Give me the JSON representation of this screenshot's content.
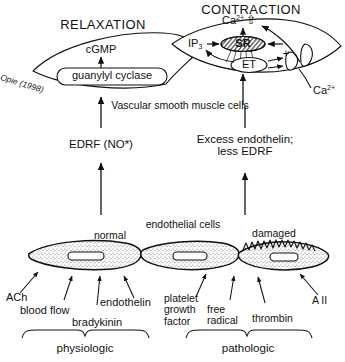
{
  "diagram": {
    "credit": "Opie (1998)",
    "headings": {
      "relaxation": "RELAXATION",
      "contraction": "CONTRACTION"
    },
    "relaxation_cell": {
      "messenger": "cGMP",
      "enzyme": "guanylyl cyclase"
    },
    "contraction_cell": {
      "calcium_increase": "Ca",
      "calcium_increase_sup": "2+",
      "calcium_increase_arrow": "⇧",
      "ip3": "IP",
      "ip3_sub": "3",
      "sr": "SR",
      "et": "ET",
      "plus": "+",
      "extracellular_calcium": "Ca",
      "extracellular_calcium_sup": "2+"
    },
    "muscle_layer_label": "Vascular smooth muscle cells",
    "mediators": {
      "left": "EDRF (NO*)",
      "right_line1": "Excess endothelin;",
      "right_line2": "less EDRF"
    },
    "endothelium": {
      "layer_label": "endothelial cells",
      "normal": "normal",
      "damaged": "damaged"
    },
    "stimuli_physiologic": [
      {
        "label": "ACh"
      },
      {
        "label": "blood flow"
      },
      {
        "label": "bradykinin"
      },
      {
        "label": "endothelin"
      }
    ],
    "stimuli_pathologic": [
      {
        "line1": "platelet",
        "line2": "growth",
        "line3": "factor"
      },
      {
        "line1": "free",
        "line2": "radical"
      },
      {
        "line1": "thrombin"
      },
      {
        "line1": "A II"
      }
    ],
    "braces": {
      "left": "physiologic",
      "right": "pathologic"
    },
    "colors": {
      "ink": "#111111",
      "background": "#ffffff",
      "stipple": "#6a6a6a"
    }
  }
}
